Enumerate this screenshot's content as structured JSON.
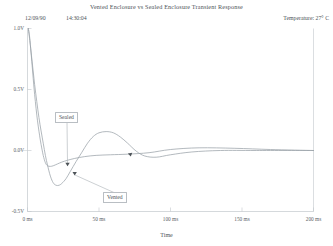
{
  "header": {
    "title": "Vented Enclosure vs Sealed Enclosure   Transient Response",
    "date": "12/09/90",
    "time": "14:30:04",
    "temperature": "Temperature:  27° C"
  },
  "colors": {
    "trace": "#9aa1a8",
    "axis": "#c3c8cd",
    "text": "#4d5358",
    "background": "#ffffff"
  },
  "annotations": {
    "sealed_label": "Sealed",
    "vented_label": "Vented"
  },
  "chart_data": {
    "type": "line",
    "title": "Vented Enclosure vs Sealed Enclosure   Transient Response",
    "xlabel": "Time",
    "ylabel": "",
    "xlim": [
      0,
      200
    ],
    "ylim": [
      -0.5,
      1.0
    ],
    "xunit": "ms",
    "yunit": "V",
    "grid": false,
    "legend": "annotated-callouts",
    "xticks": [
      0,
      50,
      100,
      150,
      200
    ],
    "xticklabels": [
      "0 ms",
      "50 ms",
      "100 ms",
      "150 ms",
      "200 ms"
    ],
    "yticks": [
      1.0,
      0.5,
      0.0,
      -0.5
    ],
    "yticklabels": [
      "1.0V",
      "0.5V",
      "0.0V",
      "-0.5V"
    ],
    "series": [
      {
        "name": "Sealed",
        "x": [
          0.6,
          1.5,
          2.5,
          3.5,
          4.5,
          5.5,
          6.5,
          7.5,
          8.5,
          9.5,
          11,
          12.5,
          14,
          16,
          18,
          21,
          24,
          28,
          33,
          40,
          48,
          58,
          70,
          85,
          100,
          120,
          145,
          170,
          200
        ],
        "y": [
          1.0,
          0.93,
          0.8,
          0.66,
          0.52,
          0.4,
          0.29,
          0.2,
          0.12,
          0.05,
          -0.04,
          -0.1,
          -0.125,
          -0.13,
          -0.125,
          -0.11,
          -0.095,
          -0.08,
          -0.065,
          -0.05,
          -0.04,
          -0.035,
          -0.03,
          -0.018,
          0.008,
          0.022,
          0.018,
          0.008,
          0.0
        ]
      },
      {
        "name": "Vented",
        "x": [
          0.6,
          2,
          3.5,
          5,
          6.5,
          8,
          9.5,
          11,
          12.5,
          14,
          16,
          18,
          20,
          22,
          24,
          27,
          30,
          34,
          38,
          42,
          46,
          50,
          55,
          60,
          65,
          70,
          76,
          82,
          90,
          100,
          115,
          135,
          160,
          200
        ],
        "y": [
          1.0,
          0.86,
          0.7,
          0.54,
          0.4,
          0.27,
          0.16,
          0.06,
          -0.04,
          -0.12,
          -0.21,
          -0.265,
          -0.285,
          -0.285,
          -0.27,
          -0.23,
          -0.17,
          -0.09,
          -0.015,
          0.06,
          0.115,
          0.145,
          0.155,
          0.145,
          0.11,
          0.06,
          -0.005,
          -0.045,
          -0.055,
          -0.035,
          -0.012,
          0.0,
          0.0,
          0.0
        ]
      }
    ],
    "callouts": [
      {
        "label": "Sealed",
        "box_x": 55,
        "box_y": 112,
        "target_x": 28,
        "target_y": -0.125
      },
      {
        "label": "Vented",
        "box_x": 103,
        "box_y": 192,
        "target_x": 33,
        "target_y": -0.2
      }
    ]
  }
}
